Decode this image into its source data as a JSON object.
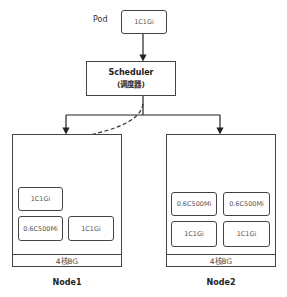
{
  "pod_label": "Pod",
  "incoming_pod": "1C1Gi",
  "scheduler": {
    "title": "Scheduler",
    "subtitle": "(调度器)"
  },
  "nodes": [
    {
      "name": "Node1",
      "capacity": "4核8G",
      "pods": [
        "1C1Gi",
        "0.6C500Mi",
        "1C1Gi"
      ]
    },
    {
      "name": "Node2",
      "capacity": "4核8G",
      "pods": [
        "0.6C500Mi",
        "0.6C500Mi",
        "1C1Gi",
        "1C1Gi"
      ]
    }
  ]
}
